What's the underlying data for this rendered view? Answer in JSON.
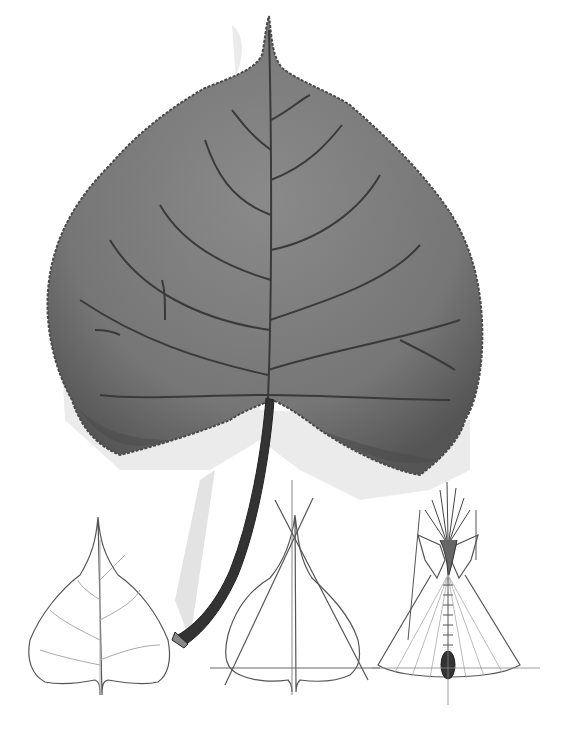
{
  "illustration": {
    "subject": "cottonwood leaf with tipi diagrams",
    "colors": {
      "background": "#ffffff",
      "leaf_fill": "#7d7d7d",
      "leaf_dark": "#4a4a4a",
      "vein": "#3a3a3a",
      "shadow": "#e2e2e2",
      "line": "#555555",
      "light_line": "#9a9a9a"
    },
    "panels": [
      {
        "name": "large-leaf",
        "label": ""
      },
      {
        "name": "outline-leaf",
        "label": ""
      },
      {
        "name": "leaf-with-triangle",
        "label": ""
      },
      {
        "name": "tipi",
        "label": ""
      }
    ]
  }
}
